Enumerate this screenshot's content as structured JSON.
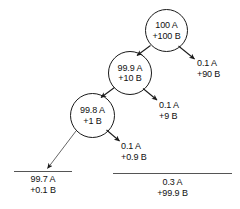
{
  "diagram": {
    "stroke_color": "#1a1a1a",
    "rule_color": "#555555",
    "background": "#ffffff",
    "nodes": [
      {
        "id": "node-top",
        "line1": "100 A",
        "line2": "+100 B"
      },
      {
        "id": "node-middle",
        "line1": "99.9 A",
        "line2": "+10 B"
      },
      {
        "id": "node-lower",
        "line1": "99.8 A",
        "line2": "+1 B"
      }
    ],
    "side_labels": [
      {
        "id": "label-top-right",
        "line1": "0.1 A",
        "line2": "+90 B"
      },
      {
        "id": "label-middle-right",
        "line1": "0.1 A",
        "line2": "+9 B"
      },
      {
        "id": "label-lower-right",
        "line1": "0.1 A",
        "line2": "+0.9 B"
      }
    ],
    "buckets": [
      {
        "id": "bucket-left",
        "line1": "99.7 A",
        "line2": "+0.1 B"
      },
      {
        "id": "bucket-right",
        "line1": "0.3 A",
        "line2": "+99.9 B"
      }
    ]
  }
}
